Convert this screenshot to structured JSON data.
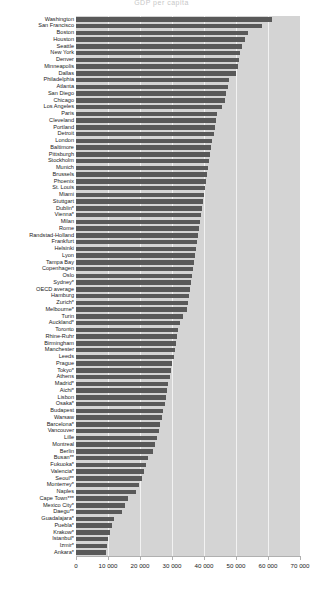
{
  "chart_data": {
    "type": "bar",
    "orientation": "horizontal",
    "title": "GDP per capita",
    "xlabel": "",
    "ylabel": "",
    "xlim": [
      0,
      70000
    ],
    "xticks": [
      0,
      10000,
      20000,
      30000,
      40000,
      50000,
      60000,
      70000
    ],
    "xticklabels": [
      "0",
      "10 000",
      "20 000",
      "30 000",
      "40 000",
      "50 000",
      "60 000",
      "70 000"
    ],
    "grid": true,
    "legend": null,
    "bar_color": "#595959",
    "plot_background": "#d4d4d4",
    "categories": [
      "Washington",
      "San Francisco",
      "Boston",
      "Houston",
      "Seattle",
      "New York",
      "Denver",
      "Minneapolis",
      "Dallas",
      "Philadelphia",
      "Atlanta",
      "San Diego",
      "Chicago",
      "Los Angeles",
      "Paris",
      "Cleveland",
      "Portland",
      "Detroit",
      "London",
      "Baltimore",
      "Pittsburgh",
      "Stockholm",
      "Munich",
      "Brussels",
      "Phoenix",
      "St. Louis",
      "Miami",
      "Stuttgart",
      "Dublin*",
      "Vienna*",
      "Milan",
      "Rome",
      "Randstad-Holland",
      "Frankfurt",
      "Helsinki",
      "Lyon",
      "Tampa Bay",
      "Copenhagen",
      "Oslo",
      "Sydney*",
      "OECD average",
      "Hamburg",
      "Zurich*",
      "Melbourne*",
      "Turin",
      "Auckland*",
      "Toronto",
      "Rhine-Ruhr",
      "Birmingham",
      "Manchester",
      "Leeds",
      "Prague",
      "Tokyo*",
      "Athens",
      "Madrid*",
      "Aichi*",
      "Lisbon",
      "Osaka*",
      "Budapest",
      "Warsaw",
      "Barcelona*",
      "Vancouver",
      "Lille",
      "Montreal",
      "Berlin",
      "Busan**",
      "Fukuoka*",
      "Valencia*",
      "Seoul**",
      "Monterrey*",
      "Naples",
      "Cape Town***",
      "Mexico City*",
      "Daegu**",
      "Guadalajara*",
      "Puebla*",
      "Krakow*",
      "Istanbul*",
      "Izmir*",
      "Ankara*"
    ],
    "values": [
      61200,
      58000,
      53600,
      52700,
      51800,
      51400,
      51000,
      50600,
      50100,
      47800,
      47400,
      47000,
      46500,
      45600,
      44000,
      43600,
      43300,
      43000,
      42600,
      42300,
      41900,
      41600,
      41200,
      40900,
      40600,
      40300,
      40000,
      39700,
      39300,
      39000,
      38700,
      38400,
      38100,
      37800,
      37400,
      37100,
      36900,
      36600,
      36300,
      36000,
      35700,
      35300,
      35000,
      34600,
      33300,
      32500,
      32000,
      31600,
      31200,
      30900,
      30500,
      30100,
      29700,
      29300,
      28900,
      28500,
      28100,
      27700,
      27200,
      26800,
      26300,
      25800,
      25300,
      24800,
      24200,
      22600,
      22000,
      21400,
      20700,
      19600,
      18700,
      16300,
      15400,
      14500,
      12000,
      11400,
      10600,
      10100,
      9700,
      9400
    ]
  }
}
